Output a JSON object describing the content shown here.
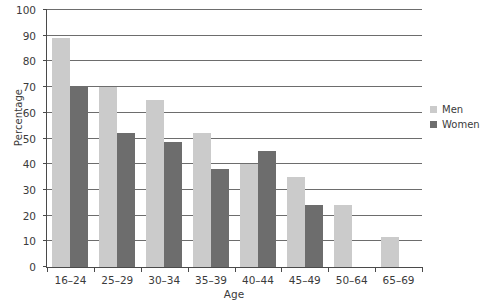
{
  "chart_data": {
    "type": "bar",
    "title": "",
    "xlabel": "Age",
    "ylabel": "Percentage",
    "categories": [
      "16–24",
      "25–29",
      "30–34",
      "35–39",
      "40–44",
      "45–49",
      "50–64",
      "65–69"
    ],
    "series": [
      {
        "name": "Men",
        "color": "#cbcbcb",
        "values": [
          89,
          70,
          65,
          52,
          40,
          35,
          24,
          11.5
        ]
      },
      {
        "name": "Women",
        "color": "#6d6d6d",
        "values": [
          70,
          52,
          48.5,
          38,
          45,
          24,
          null,
          null
        ]
      }
    ],
    "ylim": [
      0,
      100
    ],
    "yticks": [
      0,
      10,
      20,
      30,
      40,
      50,
      60,
      70,
      80,
      90,
      100
    ],
    "ytick_labels": [
      "0",
      "10",
      "20",
      "30",
      "40",
      "50",
      "60",
      "70",
      "80",
      "90",
      "100"
    ],
    "grid": true,
    "legend_position": "right"
  }
}
